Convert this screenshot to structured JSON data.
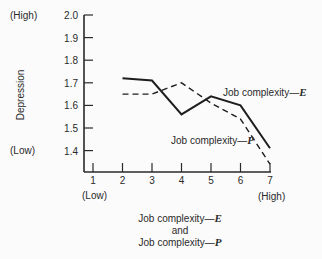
{
  "chart_data": {
    "type": "line",
    "title": "",
    "xlabel": "Job complexity-E and Job complexity-P",
    "xlabel_lines": [
      "Job complexity—",
      "and",
      "Job complexity—"
    ],
    "xlabel_suffixes": [
      "E",
      "P"
    ],
    "ylabel": "Depression",
    "x": [
      1,
      2,
      3,
      4,
      5,
      6,
      7
    ],
    "x_tick_labels": [
      "1",
      "2",
      "3",
      "4",
      "5",
      "6",
      "7"
    ],
    "x_low_label": "(Low)",
    "x_high_label": "(High)",
    "y_ticks": [
      1.4,
      1.5,
      1.6,
      1.7,
      1.8,
      1.9,
      2.0
    ],
    "y_tick_labels": [
      "1.4",
      "1.5",
      "1.6",
      "1.7",
      "1.8",
      "1.9",
      "2.0"
    ],
    "y_high_label": "(High)",
    "y_low_label": "(Low)",
    "ylim": [
      1.4,
      2.0
    ],
    "xlim": [
      1,
      7
    ],
    "grid": false,
    "series": [
      {
        "name": "Job complexity-E",
        "label": "Job complexity—",
        "suffix": "E",
        "style": "solid",
        "x": [
          2,
          3,
          4,
          5,
          6,
          7
        ],
        "values": [
          1.72,
          1.71,
          1.56,
          1.64,
          1.6,
          1.41
        ]
      },
      {
        "name": "Job complexity-P",
        "label": "Job complexity—",
        "suffix": "P",
        "style": "dashed",
        "x": [
          2,
          3,
          4,
          5,
          6,
          7
        ],
        "values": [
          1.65,
          1.65,
          1.7,
          1.61,
          1.54,
          1.34
        ]
      }
    ],
    "annotations": [
      {
        "text": "Job complexity-E",
        "near": "series E, x=6"
      },
      {
        "text": "Job complexity-P",
        "near": "series P, x=6"
      }
    ]
  }
}
